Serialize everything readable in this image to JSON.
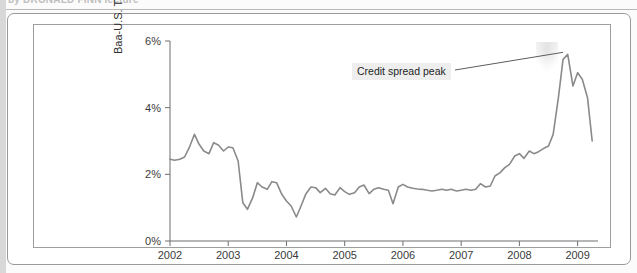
{
  "page": {
    "cropped_heading": "by DRONALD FINN lecture"
  },
  "figure": {
    "annotation": {
      "text": "Credit spread peak"
    }
  },
  "chart_data": {
    "type": "line",
    "title": "",
    "xlabel": "",
    "ylabel": "Baa-U.S. Treasury Spread (percent)",
    "xlim": [
      2002,
      2009.35
    ],
    "ylim": [
      0,
      6
    ],
    "grid": false,
    "legend": null,
    "line_color": "#8a8a8a",
    "y_ticks": [
      0,
      2,
      4,
      6
    ],
    "y_tick_labels": [
      "0%",
      "2%",
      "4%",
      "6%"
    ],
    "x_ticks": [
      2002,
      2003,
      2004,
      2005,
      2006,
      2007,
      2008,
      2009
    ],
    "x_tick_labels": [
      "2002",
      "2003",
      "2004",
      "2005",
      "2006",
      "2007",
      "2008",
      "2009"
    ],
    "annotations": [
      {
        "text": "Credit spread peak",
        "points_to_x": 2008.75,
        "points_to_y": 5.6
      }
    ],
    "series": [
      {
        "name": "Baa-U.S. Treasury Spread",
        "x": [
          2002.0,
          2002.08,
          2002.17,
          2002.25,
          2002.33,
          2002.42,
          2002.5,
          2002.58,
          2002.67,
          2002.75,
          2002.83,
          2002.92,
          2003.0,
          2003.08,
          2003.17,
          2003.25,
          2003.33,
          2003.42,
          2003.5,
          2003.58,
          2003.67,
          2003.75,
          2003.83,
          2003.92,
          2004.0,
          2004.08,
          2004.17,
          2004.25,
          2004.33,
          2004.42,
          2004.5,
          2004.58,
          2004.67,
          2004.75,
          2004.83,
          2004.92,
          2005.0,
          2005.08,
          2005.17,
          2005.25,
          2005.33,
          2005.42,
          2005.5,
          2005.58,
          2005.67,
          2005.75,
          2005.83,
          2005.92,
          2006.0,
          2006.08,
          2006.17,
          2006.25,
          2006.33,
          2006.42,
          2006.5,
          2006.58,
          2006.67,
          2006.75,
          2006.83,
          2006.92,
          2007.0,
          2007.08,
          2007.17,
          2007.25,
          2007.33,
          2007.42,
          2007.5,
          2007.58,
          2007.67,
          2007.75,
          2007.83,
          2007.92,
          2008.0,
          2008.08,
          2008.17,
          2008.25,
          2008.33,
          2008.42,
          2008.5,
          2008.58,
          2008.67,
          2008.75,
          2008.83,
          2008.92,
          2009.0,
          2009.08,
          2009.17,
          2009.25
        ],
        "y": [
          2.45,
          2.42,
          2.45,
          2.52,
          2.8,
          3.2,
          2.9,
          2.7,
          2.62,
          2.95,
          2.88,
          2.7,
          2.82,
          2.8,
          2.4,
          1.15,
          0.95,
          1.3,
          1.75,
          1.62,
          1.55,
          1.78,
          1.75,
          1.4,
          1.2,
          1.05,
          0.72,
          1.05,
          1.4,
          1.62,
          1.6,
          1.45,
          1.58,
          1.42,
          1.38,
          1.6,
          1.48,
          1.4,
          1.45,
          1.62,
          1.68,
          1.42,
          1.55,
          1.6,
          1.55,
          1.52,
          1.12,
          1.62,
          1.7,
          1.62,
          1.58,
          1.56,
          1.55,
          1.52,
          1.5,
          1.52,
          1.55,
          1.52,
          1.55,
          1.5,
          1.52,
          1.55,
          1.52,
          1.55,
          1.72,
          1.62,
          1.65,
          1.95,
          2.05,
          2.2,
          2.3,
          2.55,
          2.62,
          2.48,
          2.7,
          2.62,
          2.68,
          2.78,
          2.85,
          3.2,
          4.3,
          5.45,
          5.6,
          4.65,
          5.05,
          4.85,
          4.3,
          3.0
        ]
      }
    ]
  }
}
